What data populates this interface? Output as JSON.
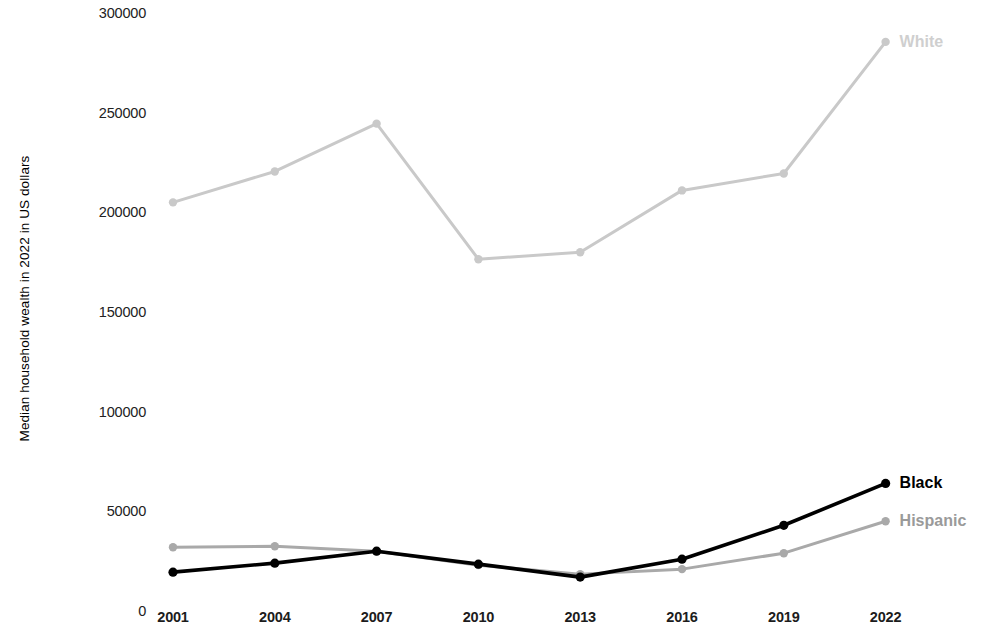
{
  "chart_data": {
    "type": "line",
    "title": "",
    "xlabel": "",
    "ylabel": "Median household wealth in 2022 in US dollars",
    "x": [
      2001,
      2004,
      2007,
      2010,
      2013,
      2016,
      2019,
      2022
    ],
    "categories": [
      "2001",
      "2004",
      "2007",
      "2010",
      "2013",
      "2016",
      "2019",
      "2022"
    ],
    "ylim": [
      0,
      300000
    ],
    "yticks": [
      0,
      50000,
      100000,
      150000,
      200000,
      250000,
      300000
    ],
    "ytick_labels": [
      "0",
      "50000",
      "100000",
      "150000",
      "200000",
      "250000",
      "300000"
    ],
    "grid": false,
    "legend_position": "right-inline-end-of-line",
    "series": [
      {
        "name": "White",
        "color": "#c9c9c9",
        "label_color": "#cfcfcf",
        "values": [
          205000,
          220500,
          244500,
          176500,
          180000,
          211000,
          219500,
          285500
        ]
      },
      {
        "name": "Black",
        "color": "#000000",
        "label_color": "#000000",
        "values": [
          19500,
          24000,
          30000,
          23500,
          17000,
          26000,
          43000,
          64000
        ]
      },
      {
        "name": "Hispanic",
        "color": "#a9a9a9",
        "label_color": "#9a9a9a",
        "values": [
          32000,
          32500,
          30000,
          23000,
          18500,
          21000,
          29000,
          45000
        ]
      }
    ]
  },
  "axis": {
    "y_title": "Median household wealth in 2022 in US dollars"
  }
}
